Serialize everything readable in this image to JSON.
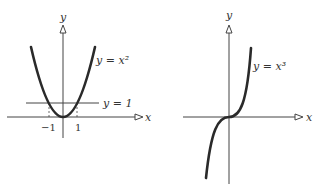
{
  "left_graph": {
    "y_axis_label": "y",
    "x_axis_label": "x",
    "curve_label": "y = x²",
    "line_label": "y = 1",
    "tick_neg": "−1",
    "tick_pos": "1"
  },
  "right_graph": {
    "y_axis_label": "y",
    "x_axis_label": "x",
    "curve_label": "y = x³"
  },
  "colors": {
    "curve": "#2a2a2a",
    "axis": "#444444",
    "background": "#ffffff"
  }
}
